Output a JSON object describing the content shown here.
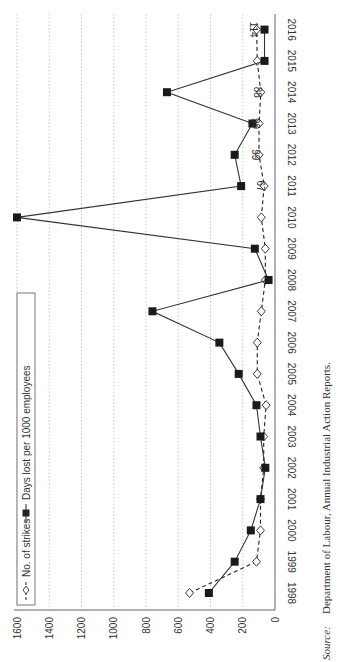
{
  "chart_data": {
    "type": "line",
    "orientation": "rotated-90-clockwise",
    "title": "",
    "xlabel": "",
    "ylabel": "",
    "ylim": [
      0,
      1600
    ],
    "yticks": [
      0,
      200,
      400,
      600,
      800,
      1000,
      1200,
      1400,
      1600
    ],
    "grid": "dotted, y-axis",
    "categories": [
      "1998",
      "1999",
      "2000",
      "2001",
      "2002",
      "2003",
      "2004",
      "2005",
      "2006",
      "2007",
      "2008",
      "2009",
      "2010",
      "2011",
      "2012",
      "2013",
      "2014",
      "2015",
      "2016"
    ],
    "series": [
      {
        "name": "No. of strikes",
        "style": "dashed line, hollow diamond markers",
        "values": [
          530,
          115,
          90,
          90,
          70,
          70,
          55,
          110,
          110,
          85,
          60,
          60,
          85,
          67,
          99,
          99,
          88,
          110,
          114
        ]
      },
      {
        "name": "Days lost per 1000 employees",
        "style": "solid line, filled square markers",
        "values": [
          410,
          250,
          150,
          90,
          60,
          90,
          115,
          225,
          345,
          760,
          40,
          125,
          1600,
          210,
          250,
          140,
          670,
          65,
          65
        ]
      }
    ],
    "annotations": [
      {
        "category": "2011",
        "series": "No. of strikes",
        "text": "67"
      },
      {
        "category": "2012",
        "series": "No. of strikes",
        "text": "99"
      },
      {
        "category": "2013",
        "series": "No. of strikes",
        "text": "99"
      },
      {
        "category": "2014",
        "series": "No. of strikes",
        "text": "88"
      },
      {
        "category": "2016",
        "series": "No. of strikes",
        "text": "114"
      }
    ],
    "legend": {
      "position": "top-left (inside plot)",
      "entries": [
        "No. of strikes",
        "Days lost per 1000 employees"
      ]
    }
  },
  "source": {
    "label": "Source:",
    "text": "Department of Labour, Annual Industrial Action Reports."
  }
}
